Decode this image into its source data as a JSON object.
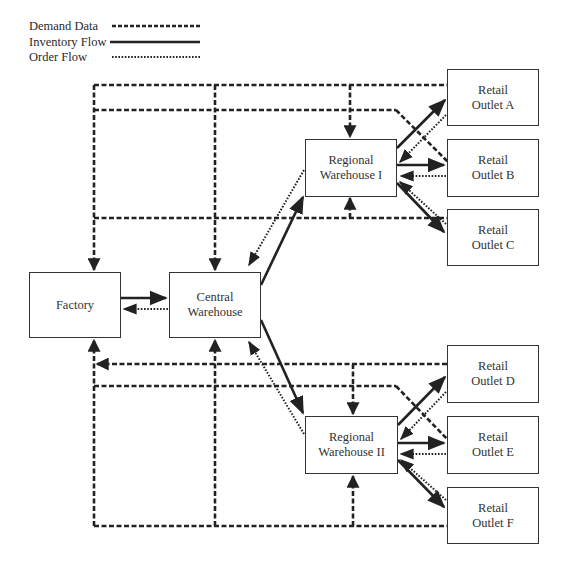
{
  "legend": {
    "items": [
      {
        "label": "Demand Data",
        "style": "dashed"
      },
      {
        "label": "Inventory Flow",
        "style": "solid"
      },
      {
        "label": "Order Flow",
        "style": "dotted"
      }
    ]
  },
  "nodes": {
    "factory": {
      "lines": [
        "Factory"
      ]
    },
    "central_warehouse": {
      "lines": [
        "Central",
        "Warehouse"
      ]
    },
    "regional_warehouse_1": {
      "lines": [
        "Regional",
        "Warehouse I"
      ]
    },
    "regional_warehouse_2": {
      "lines": [
        "Regional",
        "Warehouse II"
      ]
    },
    "retail_a": {
      "lines": [
        "Retail",
        "Outlet A"
      ]
    },
    "retail_b": {
      "lines": [
        "Retail",
        "Outlet B"
      ]
    },
    "retail_c": {
      "lines": [
        "Retail",
        "Outlet C"
      ]
    },
    "retail_d": {
      "lines": [
        "Retail",
        "Outlet D"
      ]
    },
    "retail_e": {
      "lines": [
        "Retail",
        "Outlet E"
      ]
    },
    "retail_f": {
      "lines": [
        "Retail",
        "Outlet F"
      ]
    }
  },
  "colors": {
    "line": "#222222",
    "box_border": "#333333",
    "text": "#333333",
    "background": "#ffffff"
  }
}
